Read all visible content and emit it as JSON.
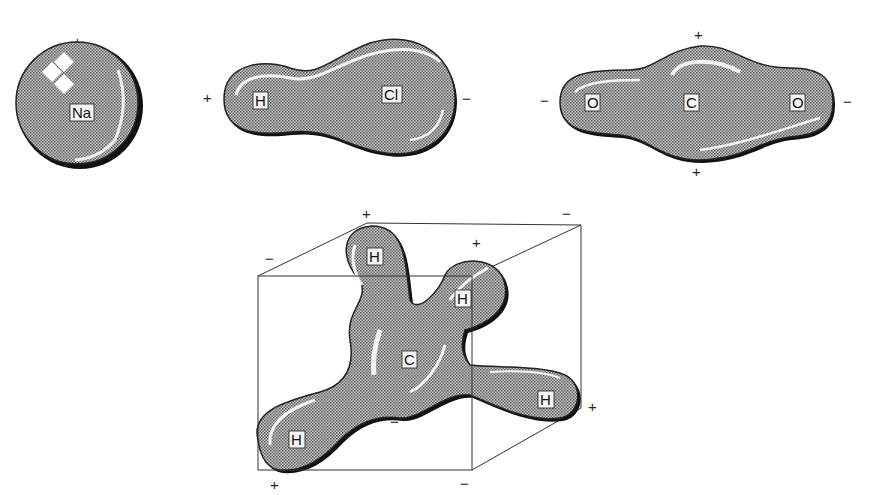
{
  "figure": {
    "colors": {
      "background": "#ffffff",
      "cloud_fill": "#a8a8a8",
      "cloud_outline": "#111111",
      "highlight": "#ffffff",
      "cube_line": "#333333"
    }
  },
  "molecules": {
    "sodium": {
      "atoms": [
        "Na"
      ],
      "signs": {
        "top": "+"
      }
    },
    "hydrogen_chloride": {
      "atoms": [
        "H",
        "Cl"
      ],
      "signs": {
        "left": "+",
        "right": "−"
      }
    },
    "carbon_dioxide": {
      "atoms": [
        "O",
        "C",
        "O"
      ],
      "signs": {
        "left": "−",
        "right": "−",
        "top": "+",
        "bottom": "+"
      }
    },
    "methane": {
      "atoms": [
        "H",
        "H",
        "C",
        "H",
        "H"
      ],
      "signs": {
        "back_top_left": "+",
        "back_top_right": "−",
        "front_top_left": "−",
        "front_top_right": "+",
        "back_bottom_right": "+",
        "front_bottom_left": "+",
        "front_bottom_right": "−",
        "back_bottom_left": "−"
      }
    }
  }
}
